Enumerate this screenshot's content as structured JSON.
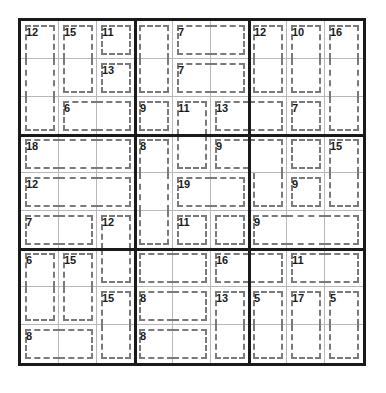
{
  "puzzle": {
    "type": "Killer Sudoku",
    "size": 9,
    "box_size": 3,
    "cages": [
      {
        "sum": "12",
        "cells": [
          [
            1,
            1
          ],
          [
            2,
            1
          ],
          [
            3,
            1
          ]
        ]
      },
      {
        "sum": "15",
        "cells": [
          [
            1,
            2
          ],
          [
            2,
            2
          ]
        ]
      },
      {
        "sum": "11",
        "cells": [
          [
            1,
            3
          ]
        ]
      },
      {
        "sum": "13",
        "cells": [
          [
            2,
            3
          ]
        ]
      },
      {
        "sum": "6",
        "cells": [
          [
            3,
            2
          ],
          [
            3,
            3
          ]
        ]
      },
      {
        "sum": "",
        "cells": [
          [
            1,
            4
          ],
          [
            2,
            4
          ]
        ]
      },
      {
        "sum": "7",
        "cells": [
          [
            1,
            5
          ],
          [
            1,
            6
          ]
        ]
      },
      {
        "sum": "7",
        "cells": [
          [
            2,
            5
          ],
          [
            2,
            6
          ]
        ]
      },
      {
        "sum": "9",
        "cells": [
          [
            3,
            4
          ]
        ]
      },
      {
        "sum": "11",
        "cells": [
          [
            3,
            5
          ],
          [
            4,
            5
          ]
        ]
      },
      {
        "sum": "13",
        "cells": [
          [
            3,
            6
          ],
          [
            3,
            7
          ]
        ]
      },
      {
        "sum": "12",
        "cells": [
          [
            1,
            7
          ],
          [
            2,
            7
          ]
        ]
      },
      {
        "sum": "10",
        "cells": [
          [
            1,
            8
          ],
          [
            2,
            8
          ]
        ]
      },
      {
        "sum": "16",
        "cells": [
          [
            1,
            9
          ],
          [
            2,
            9
          ],
          [
            3,
            9
          ]
        ]
      },
      {
        "sum": "7",
        "cells": [
          [
            3,
            8
          ]
        ]
      },
      {
        "sum": "18",
        "cells": [
          [
            4,
            1
          ],
          [
            4,
            2
          ],
          [
            4,
            3
          ]
        ]
      },
      {
        "sum": "12",
        "cells": [
          [
            5,
            1
          ],
          [
            5,
            2
          ],
          [
            5,
            3
          ]
        ]
      },
      {
        "sum": "7",
        "cells": [
          [
            6,
            1
          ],
          [
            6,
            2
          ]
        ]
      },
      {
        "sum": "12",
        "cells": [
          [
            6,
            3
          ],
          [
            7,
            3
          ]
        ]
      },
      {
        "sum": "8",
        "cells": [
          [
            4,
            4
          ],
          [
            5,
            4
          ],
          [
            6,
            4
          ]
        ]
      },
      {
        "sum": "19",
        "cells": [
          [
            5,
            5
          ],
          [
            5,
            6
          ]
        ]
      },
      {
        "sum": "11",
        "cells": [
          [
            6,
            5
          ]
        ]
      },
      {
        "sum": "",
        "cells": [
          [
            6,
            6
          ],
          [
            7,
            4
          ],
          [
            7,
            5
          ]
        ]
      },
      {
        "sum": "9",
        "cells": [
          [
            4,
            6
          ],
          [
            4,
            7
          ],
          [
            5,
            7
          ]
        ]
      },
      {
        "sum": "",
        "cells": [
          [
            4,
            8
          ]
        ]
      },
      {
        "sum": "15",
        "cells": [
          [
            4,
            9
          ],
          [
            5,
            9
          ]
        ]
      },
      {
        "sum": "9",
        "cells": [
          [
            5,
            8
          ]
        ]
      },
      {
        "sum": "9",
        "cells": [
          [
            6,
            7
          ],
          [
            6,
            8
          ],
          [
            6,
            9
          ]
        ]
      },
      {
        "sum": "6",
        "cells": [
          [
            7,
            1
          ],
          [
            8,
            1
          ]
        ]
      },
      {
        "sum": "15",
        "cells": [
          [
            7,
            2
          ],
          [
            8,
            2
          ]
        ]
      },
      {
        "sum": "15",
        "cells": [
          [
            8,
            3
          ],
          [
            9,
            3
          ]
        ]
      },
      {
        "sum": "16",
        "cells": [
          [
            7,
            6
          ],
          [
            7,
            7
          ]
        ]
      },
      {
        "sum": "11",
        "cells": [
          [
            7,
            8
          ],
          [
            7,
            9
          ]
        ]
      },
      {
        "sum": "8",
        "cells": [
          [
            8,
            4
          ],
          [
            8,
            5
          ]
        ]
      },
      {
        "sum": "13",
        "cells": [
          [
            8,
            6
          ],
          [
            9,
            6
          ]
        ]
      },
      {
        "sum": "5",
        "cells": [
          [
            8,
            7
          ],
          [
            9,
            7
          ]
        ]
      },
      {
        "sum": "17",
        "cells": [
          [
            8,
            8
          ],
          [
            9,
            8
          ]
        ]
      },
      {
        "sum": "5",
        "cells": [
          [
            8,
            9
          ],
          [
            9,
            9
          ]
        ]
      },
      {
        "sum": "8",
        "cells": [
          [
            9,
            1
          ],
          [
            9,
            2
          ]
        ]
      },
      {
        "sum": "8",
        "cells": [
          [
            9,
            4
          ],
          [
            9,
            5
          ]
        ]
      }
    ],
    "values": []
  },
  "colors": {
    "box_line": "#1a1a1a",
    "cell_line": "#b8b8b8",
    "cage_line": "#7a7a7a",
    "text": "#1a1a1a",
    "background": "#ffffff"
  }
}
